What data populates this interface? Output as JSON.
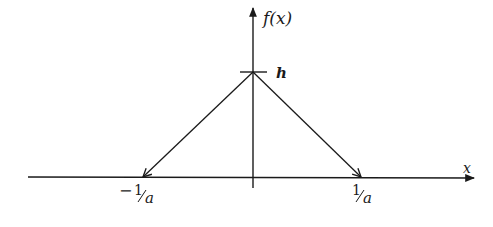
{
  "figure": {
    "type": "triangular-function-plot",
    "y_axis_label": "f(x)",
    "x_axis_label": "x",
    "peak_label": "h",
    "left_tick": {
      "sign": "−",
      "numerator": "1",
      "denominator": "a"
    },
    "right_tick": {
      "numerator": "1",
      "denominator": "a"
    },
    "colors": {
      "ink": "#1a1a1a",
      "background": "#ffffff"
    }
  }
}
